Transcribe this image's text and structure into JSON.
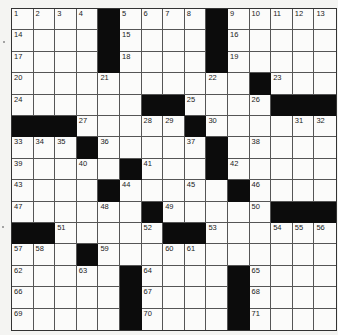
{
  "puzzle": {
    "rows": 15,
    "cols": 15,
    "layout": [
      "....#....#.....",
      "....#....#.....",
      "....#....#.....",
      "...........#...",
      "......##....###",
      "###.....#......",
      "...#.....#.....",
      ".....#...#.....",
      "....#.....#....",
      "......#.....###",
      "##.....##......",
      "...#...........",
      ".....#....#....",
      ".....#....#....",
      ".....#....#...."
    ],
    "numbers": [
      {
        "r": 0,
        "c": 0,
        "n": "1"
      },
      {
        "r": 0,
        "c": 1,
        "n": "2"
      },
      {
        "r": 0,
        "c": 2,
        "n": "3"
      },
      {
        "r": 0,
        "c": 3,
        "n": "4"
      },
      {
        "r": 0,
        "c": 5,
        "n": "5"
      },
      {
        "r": 0,
        "c": 6,
        "n": "6"
      },
      {
        "r": 0,
        "c": 7,
        "n": "7"
      },
      {
        "r": 0,
        "c": 8,
        "n": "8"
      },
      {
        "r": 0,
        "c": 10,
        "n": "9"
      },
      {
        "r": 0,
        "c": 11,
        "n": "10"
      },
      {
        "r": 0,
        "c": 12,
        "n": "11"
      },
      {
        "r": 0,
        "c": 13,
        "n": "12"
      },
      {
        "r": 0,
        "c": 14,
        "n": "13"
      },
      {
        "r": 1,
        "c": 0,
        "n": "14"
      },
      {
        "r": 1,
        "c": 5,
        "n": "15"
      },
      {
        "r": 1,
        "c": 10,
        "n": "16"
      },
      {
        "r": 2,
        "c": 0,
        "n": "17"
      },
      {
        "r": 2,
        "c": 5,
        "n": "18"
      },
      {
        "r": 2,
        "c": 10,
        "n": "19"
      },
      {
        "r": 3,
        "c": 0,
        "n": "20"
      },
      {
        "r": 3,
        "c": 4,
        "n": "21"
      },
      {
        "r": 3,
        "c": 9,
        "n": "22"
      },
      {
        "r": 3,
        "c": 12,
        "n": "23"
      },
      {
        "r": 4,
        "c": 0,
        "n": "24"
      },
      {
        "r": 4,
        "c": 8,
        "n": "25"
      },
      {
        "r": 4,
        "c": 11,
        "n": "26"
      },
      {
        "r": 5,
        "c": 3,
        "n": "27"
      },
      {
        "r": 5,
        "c": 6,
        "n": "28"
      },
      {
        "r": 5,
        "c": 7,
        "n": "29"
      },
      {
        "r": 5,
        "c": 9,
        "n": "30"
      },
      {
        "r": 5,
        "c": 13,
        "n": "31"
      },
      {
        "r": 5,
        "c": 14,
        "n": "32"
      },
      {
        "r": 6,
        "c": 0,
        "n": "33"
      },
      {
        "r": 6,
        "c": 1,
        "n": "34"
      },
      {
        "r": 6,
        "c": 2,
        "n": "35"
      },
      {
        "r": 6,
        "c": 4,
        "n": "36"
      },
      {
        "r": 6,
        "c": 8,
        "n": "37"
      },
      {
        "r": 6,
        "c": 11,
        "n": "38"
      },
      {
        "r": 7,
        "c": 0,
        "n": "39"
      },
      {
        "r": 7,
        "c": 3,
        "n": "40"
      },
      {
        "r": 7,
        "c": 6,
        "n": "41"
      },
      {
        "r": 7,
        "c": 10,
        "n": "42"
      },
      {
        "r": 8,
        "c": 0,
        "n": "43"
      },
      {
        "r": 8,
        "c": 5,
        "n": "44"
      },
      {
        "r": 8,
        "c": 8,
        "n": "45"
      },
      {
        "r": 8,
        "c": 11,
        "n": "46"
      },
      {
        "r": 9,
        "c": 0,
        "n": "47"
      },
      {
        "r": 9,
        "c": 4,
        "n": "48"
      },
      {
        "r": 9,
        "c": 7,
        "n": "49"
      },
      {
        "r": 9,
        "c": 11,
        "n": "50"
      },
      {
        "r": 10,
        "c": 2,
        "n": "51"
      },
      {
        "r": 10,
        "c": 6,
        "n": "52"
      },
      {
        "r": 10,
        "c": 9,
        "n": "53"
      },
      {
        "r": 10,
        "c": 12,
        "n": "54"
      },
      {
        "r": 10,
        "c": 13,
        "n": "55"
      },
      {
        "r": 10,
        "c": 14,
        "n": "56"
      },
      {
        "r": 11,
        "c": 0,
        "n": "57"
      },
      {
        "r": 11,
        "c": 1,
        "n": "58"
      },
      {
        "r": 11,
        "c": 4,
        "n": "59"
      },
      {
        "r": 11,
        "c": 7,
        "n": "60"
      },
      {
        "r": 11,
        "c": 8,
        "n": "61"
      },
      {
        "r": 12,
        "c": 0,
        "n": "62"
      },
      {
        "r": 12,
        "c": 3,
        "n": "63"
      },
      {
        "r": 12,
        "c": 6,
        "n": "64"
      },
      {
        "r": 12,
        "c": 11,
        "n": "65"
      },
      {
        "r": 13,
        "c": 0,
        "n": "66"
      },
      {
        "r": 13,
        "c": 6,
        "n": "67"
      },
      {
        "r": 13,
        "c": 11,
        "n": "68"
      },
      {
        "r": 14,
        "c": 0,
        "n": "69"
      },
      {
        "r": 14,
        "c": 6,
        "n": "70"
      },
      {
        "r": 14,
        "c": 11,
        "n": "71"
      }
    ]
  },
  "colors": {
    "block": "#0c0c0c",
    "cell": "#fbfbfa",
    "background": "#f4f4f2",
    "grid_line": "#555555"
  }
}
